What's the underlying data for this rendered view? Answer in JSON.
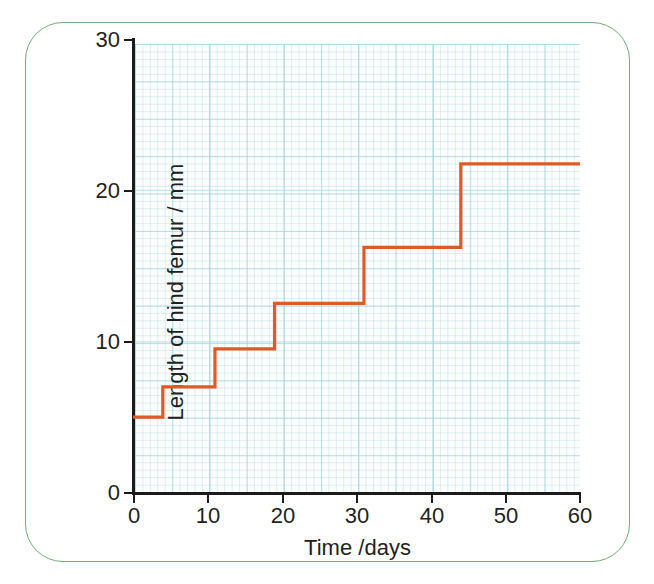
{
  "figure": {
    "frame_color": "#6fae7c",
    "plot_background": "#fbfdfd",
    "grid_color": "#9ccdd4",
    "axis_color": "#1b1b1b"
  },
  "chart_data": {
    "type": "line",
    "subtype": "step",
    "title": "",
    "subtitle": "",
    "xlabel": "Time /days",
    "ylabel": "Length of hind femur / mm",
    "xlim": [
      0,
      60
    ],
    "ylim": [
      0,
      30
    ],
    "xticks": [
      0,
      10,
      20,
      30,
      40,
      50,
      60
    ],
    "yticks": [
      0,
      10,
      20,
      30
    ],
    "xtick_labels": [
      "0",
      "10",
      "20",
      "30",
      "40",
      "50",
      "60"
    ],
    "ytick_labels": [
      "0",
      "10",
      "20",
      "30"
    ],
    "grid": true,
    "grid_style": "graph-paper",
    "legend": false,
    "legend_position": "none",
    "series": [
      {
        "name": "Length of hind femur",
        "color": "#e05a28",
        "line_width": 3.2,
        "step_mode": "post",
        "x": [
          0,
          4,
          11,
          19,
          31,
          44,
          60
        ],
        "y": [
          5.0,
          7.0,
          9.5,
          12.5,
          16.2,
          21.7,
          21.7
        ],
        "points": [
          {
            "x": 0,
            "y": 5.0
          },
          {
            "x": 4,
            "y": 5.0
          },
          {
            "x": 4,
            "y": 7.0
          },
          {
            "x": 11,
            "y": 7.0
          },
          {
            "x": 11,
            "y": 9.5
          },
          {
            "x": 19,
            "y": 9.5
          },
          {
            "x": 19,
            "y": 12.5
          },
          {
            "x": 31,
            "y": 12.5
          },
          {
            "x": 31,
            "y": 16.2
          },
          {
            "x": 44,
            "y": 16.2
          },
          {
            "x": 44,
            "y": 21.7
          },
          {
            "x": 60,
            "y": 21.7
          }
        ]
      }
    ],
    "annotations": []
  }
}
